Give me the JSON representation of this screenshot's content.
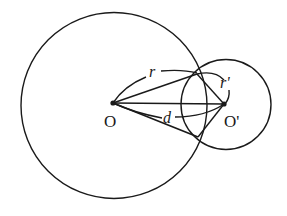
{
  "diagram": {
    "colors": {
      "stroke": "#1a1a1a",
      "background": "#ffffff"
    },
    "circles": [
      {
        "id": "large-circle",
        "center_label": "O",
        "cx": 114,
        "cy": 105,
        "r": 93
      },
      {
        "id": "small-circle",
        "center_label": "O'",
        "cx": 226,
        "cy": 104,
        "r": 45
      }
    ],
    "points": {
      "O": {
        "x": 113,
        "y": 103,
        "label": "O"
      },
      "O_prime": {
        "x": 224,
        "y": 104,
        "label": "O'"
      },
      "upper_intersection": {
        "x": 197,
        "y": 74
      },
      "lower_intersection": {
        "x": 198,
        "y": 137
      }
    },
    "labels": {
      "O": "O",
      "O_prime": "O'",
      "r": "r",
      "r_prime": "r'",
      "d": "d"
    },
    "segments": [
      {
        "from": "O",
        "to": "upper_intersection"
      },
      {
        "from": "O",
        "to": "O_prime"
      },
      {
        "from": "O",
        "to": "lower_intersection"
      },
      {
        "from": "upper_intersection",
        "to": "O_prime"
      },
      {
        "from": "lower_intersection",
        "to": "O_prime"
      },
      {
        "from": "upper_intersection",
        "to": "lower_intersection",
        "note": "lens arcs"
      }
    ],
    "dimension_arcs": [
      {
        "label": "r",
        "between": [
          "O",
          "upper_intersection"
        ]
      },
      {
        "label": "r'",
        "between": [
          "upper_intersection",
          "O_prime"
        ]
      },
      {
        "label": "d",
        "between": [
          "O",
          "O_prime"
        ]
      }
    ]
  }
}
